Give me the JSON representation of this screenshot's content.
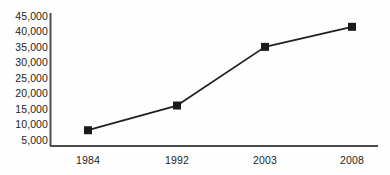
{
  "chart_data": {
    "type": "line",
    "title": "",
    "subtitle": "",
    "xlabel": "",
    "ylabel": "",
    "categories": [
      "1984",
      "1992",
      "2003",
      "2008"
    ],
    "x": [
      1984,
      1992,
      2003,
      2008
    ],
    "values": [
      8000,
      16000,
      35000,
      41500
    ],
    "series": [
      {
        "name": "",
        "values": [
          8000,
          16000,
          35000,
          41500
        ]
      }
    ],
    "ytick_labels": [
      "45,000",
      "40,000",
      "35,000",
      "30,000",
      "25,000",
      "20,000",
      "15,000",
      "10,000",
      "5,000"
    ],
    "ytick_values": [
      45000,
      40000,
      35000,
      30000,
      25000,
      20000,
      15000,
      10000,
      5000
    ],
    "xtick_labels": [
      "1984",
      "1992",
      "2003",
      "2008"
    ],
    "ylim": [
      5000,
      45000
    ],
    "grid": false,
    "legend": "none",
    "marker": "square",
    "marker_color": "#1a1a1a",
    "line_color": "#231f20",
    "axis_color": "#4d4d4d",
    "background_color": "#fefefe"
  }
}
